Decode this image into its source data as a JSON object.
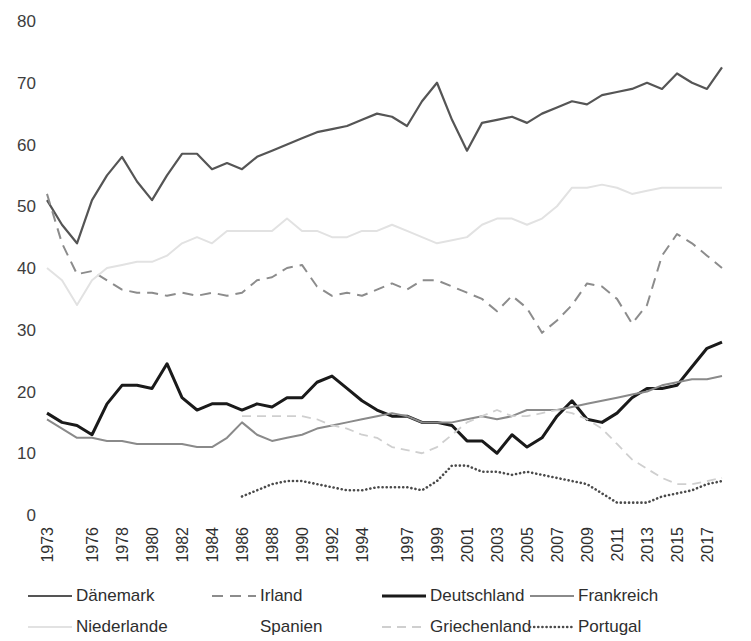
{
  "chart_data": {
    "type": "line",
    "title": "",
    "subtitle": "",
    "xlabel": "",
    "ylabel": "",
    "xlim": [
      1973,
      2018
    ],
    "ylim": [
      0,
      80
    ],
    "yticks": [
      0,
      10,
      20,
      30,
      40,
      50,
      60,
      70,
      80
    ],
    "grid": false,
    "legend_position": "bottom",
    "xtick_labels": [
      "1973",
      "1976",
      "1978",
      "1980",
      "1982",
      "1984",
      "1986",
      "1988",
      "1990",
      "1992",
      "1994",
      "1997",
      "1999",
      "2001",
      "2003",
      "2005",
      "2007",
      "2009",
      "2011",
      "2013",
      "2015",
      "2017"
    ],
    "x": [
      1973,
      1974,
      1975,
      1976,
      1977,
      1978,
      1979,
      1980,
      1981,
      1982,
      1983,
      1984,
      1985,
      1986,
      1987,
      1988,
      1989,
      1990,
      1991,
      1992,
      1993,
      1994,
      1995,
      1996,
      1997,
      1998,
      1999,
      2000,
      2001,
      2002,
      2003,
      2004,
      2005,
      2006,
      2007,
      2008,
      2009,
      2010,
      2011,
      2012,
      2013,
      2014,
      2015,
      2016,
      2017,
      2018
    ],
    "series": [
      {
        "name": "Dänemark",
        "color": "#555555",
        "style": "solid",
        "width": 2.2,
        "values": [
          51,
          47,
          44,
          51,
          55,
          58,
          54,
          51,
          55,
          58.5,
          58.5,
          56,
          57,
          56,
          58,
          59,
          60,
          61,
          62,
          62.5,
          63,
          64,
          65,
          64.5,
          63,
          67,
          70,
          64,
          59,
          63.5,
          64,
          64.5,
          63.5,
          65,
          66,
          67,
          66.5,
          68,
          68.5,
          69,
          70,
          69,
          71.5,
          70,
          69,
          72.5
        ]
      },
      {
        "name": "Irland",
        "color": "#8c8c8c",
        "style": "dashed",
        "width": 2.0,
        "values": [
          52,
          44,
          39,
          39.5,
          38,
          36.5,
          36,
          36,
          35.5,
          36,
          35.5,
          36,
          35.5,
          36,
          38,
          38.5,
          40,
          40.5,
          37,
          35.5,
          36,
          35.5,
          36.5,
          37.5,
          36.5,
          38,
          38,
          37,
          36,
          35,
          33,
          35.5,
          33.5,
          29.5,
          31.5,
          34,
          37.5,
          37,
          35,
          31,
          34,
          42,
          45.5,
          44,
          42,
          40
        ]
      },
      {
        "name": "Deutschland",
        "color": "#1a1a1a",
        "style": "solid",
        "width": 3.0,
        "values": [
          16.5,
          15,
          14.5,
          13,
          18,
          21,
          21,
          20.5,
          24.5,
          19,
          17,
          18,
          18,
          17,
          18,
          17.5,
          19,
          19,
          21.5,
          22.5,
          20.5,
          18.5,
          17,
          16,
          16,
          15,
          15,
          14.5,
          12,
          12,
          10,
          13,
          11,
          12.5,
          16,
          18.5,
          15.5,
          15,
          16.5,
          19,
          20.5,
          20.5,
          21,
          24,
          27,
          28
        ]
      },
      {
        "name": "Frankreich",
        "color": "#8a8a8a",
        "style": "solid",
        "width": 2.0,
        "values": [
          15.5,
          14,
          12.5,
          12.5,
          12,
          12,
          11.5,
          11.5,
          11.5,
          11.5,
          11,
          11,
          12.5,
          15,
          13,
          12,
          12.5,
          13,
          14,
          14.5,
          15,
          15.5,
          16,
          16.5,
          16,
          15,
          15,
          15,
          15.5,
          16,
          15.5,
          16,
          17,
          17,
          17,
          17.5,
          18,
          18.5,
          19,
          19.5,
          20,
          21,
          21.5,
          22,
          22,
          22.5
        ]
      },
      {
        "name": "Niederlande",
        "color": "#e2e2e2",
        "style": "solid",
        "width": 2.0,
        "values": [
          40,
          38,
          34,
          38,
          40,
          40.5,
          41,
          41,
          42,
          44,
          45,
          44,
          46,
          46,
          46,
          46,
          48,
          46,
          46,
          45,
          45,
          46,
          46,
          47,
          46,
          45,
          44,
          44.5,
          45,
          47,
          48,
          48,
          47,
          48,
          50,
          53,
          53,
          53.5,
          53,
          52,
          52.5,
          53,
          53,
          53,
          53,
          53
        ]
      },
      {
        "name": "Spanien",
        "color": "#fbfbfb",
        "style": "solid",
        "width": 2.0,
        "values": [
          null,
          null,
          null,
          null,
          null,
          null,
          null,
          null,
          null,
          null,
          null,
          null,
          null,
          null,
          null,
          null,
          null,
          null,
          null,
          null,
          null,
          null,
          null,
          null,
          null,
          null,
          null,
          null,
          null,
          null,
          null,
          null,
          null,
          null,
          null,
          null,
          null,
          null,
          null,
          null,
          null,
          null,
          null,
          null,
          null,
          null
        ]
      },
      {
        "name": "Griechenland",
        "color": "#cfcfcf",
        "style": "dashed-light",
        "width": 1.8,
        "values": [
          null,
          null,
          null,
          null,
          null,
          null,
          null,
          null,
          null,
          null,
          null,
          null,
          null,
          16,
          16,
          16,
          16,
          16,
          15.5,
          14.5,
          14,
          13,
          12.5,
          11,
          10.5,
          10,
          11,
          13,
          15,
          16,
          17,
          16,
          16,
          16.5,
          17,
          16.5,
          15.5,
          14,
          11.5,
          9,
          7.5,
          6,
          5,
          5,
          5.5,
          6
        ]
      },
      {
        "name": "Portugal",
        "color": "#4a4a4a",
        "style": "dotted",
        "width": 2.6,
        "values": [
          null,
          null,
          null,
          null,
          null,
          null,
          null,
          null,
          null,
          null,
          null,
          null,
          null,
          3,
          4,
          5,
          5.5,
          5.5,
          5,
          4.5,
          4,
          4,
          4.5,
          4.5,
          4.5,
          4,
          5.5,
          8,
          8,
          7,
          7,
          6.5,
          7,
          6.5,
          6,
          5.5,
          5,
          3.5,
          2,
          2,
          2,
          3,
          3.5,
          4,
          5,
          5.5
        ]
      }
    ]
  },
  "legend": {
    "items": [
      {
        "label": "Dänemark",
        "swatch": "solid-dark"
      },
      {
        "label": "Irland",
        "swatch": "dashed-gray"
      },
      {
        "label": "Deutschland",
        "swatch": "solid-black"
      },
      {
        "label": "Frankreich",
        "swatch": "solid-gray"
      },
      {
        "label": "Niederlande",
        "swatch": "solid-verylight"
      },
      {
        "label": "Spanien",
        "swatch": "solid-white"
      },
      {
        "label": "Griechenland",
        "swatch": "dashed-light"
      },
      {
        "label": "Portugal",
        "swatch": "dotted-dark"
      }
    ]
  },
  "colors": {
    "denmark": "#555555",
    "ireland": "#8c8c8c",
    "germany": "#1a1a1a",
    "france": "#8a8a8a",
    "netherlands": "#e2e2e2",
    "spain": "#fbfbfb",
    "greece": "#cfcfcf",
    "portugal": "#4a4a4a",
    "text": "#2e2e2e",
    "background": "#ffffff"
  }
}
